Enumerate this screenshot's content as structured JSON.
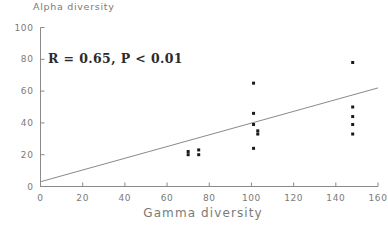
{
  "chart_data": {
    "type": "scatter",
    "title": "",
    "xlabel": "Gamma diversity",
    "ylabel": "Alpha diversity",
    "xlim": [
      0,
      160
    ],
    "ylim": [
      0,
      100
    ],
    "xticks": [
      0,
      20,
      40,
      60,
      80,
      100,
      120,
      140,
      160
    ],
    "yticks": [
      0,
      20,
      40,
      60,
      80,
      100
    ],
    "xtick_labels": [
      "0",
      "20",
      "40",
      "60",
      "80",
      "100",
      "120",
      "140",
      "160"
    ],
    "ytick_labels": [
      "0",
      "20",
      "40",
      "60",
      "80",
      "100"
    ],
    "grid": false,
    "legend": null,
    "annotation": "R = 0.65, P < 0.01",
    "annotations": [
      {
        "text": "R = 0.65, P < 0.01",
        "x": 20,
        "y": 74,
        "correlation_r": 0.65,
        "p_value_text": "P < 0.01"
      }
    ],
    "points": [
      {
        "x": 70,
        "y": 22
      },
      {
        "x": 70,
        "y": 20
      },
      {
        "x": 75,
        "y": 23
      },
      {
        "x": 75,
        "y": 20
      },
      {
        "x": 101,
        "y": 65
      },
      {
        "x": 101,
        "y": 46
      },
      {
        "x": 101,
        "y": 39
      },
      {
        "x": 103,
        "y": 35
      },
      {
        "x": 103,
        "y": 33
      },
      {
        "x": 101,
        "y": 24
      },
      {
        "x": 148,
        "y": 78
      },
      {
        "x": 148,
        "y": 50
      },
      {
        "x": 148,
        "y": 44
      },
      {
        "x": 148,
        "y": 39
      },
      {
        "x": 148,
        "y": 33
      }
    ],
    "trendline": {
      "label": "regression line",
      "x_start": 0,
      "y_start": 3,
      "x_end": 160,
      "y_end": 62
    },
    "colors": {
      "point": "#1a1a1a",
      "line": "#8a8a8a",
      "axis": "#8a8a8a",
      "tick_label": "#7a7a7a",
      "annotation": "#2b2b2b",
      "background": "#ffffff"
    }
  }
}
